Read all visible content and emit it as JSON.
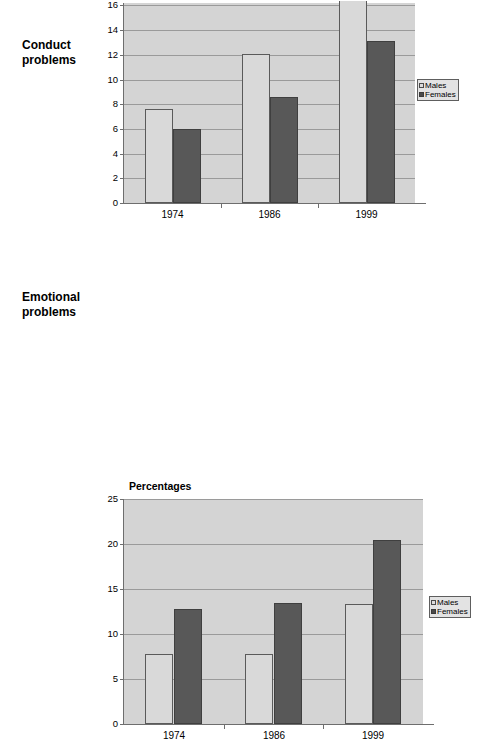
{
  "page": {
    "background": "#ffffff"
  },
  "colors": {
    "plot_background": "#d4d4d4",
    "males_fill": "#d9d9d9",
    "males_border": "#5a5a5a",
    "females_fill": "#585858",
    "females_border": "#3f3f3f",
    "gridline": "#9a9a9a",
    "axis": "#6e6e6e",
    "text": "#000000"
  },
  "panels": [
    {
      "id": "conduct",
      "row_label": "Conduct\nproblems"
    },
    {
      "id": "emotional",
      "row_label": "Emotional\nproblems"
    }
  ],
  "legend": {
    "series": [
      {
        "name": "Males",
        "swatch": "males"
      },
      {
        "name": "Females",
        "swatch": "females"
      }
    ]
  },
  "chart_data": [
    {
      "id": "conduct",
      "type": "bar",
      "title": "",
      "row_label": "Conduct problems",
      "xlabel": "",
      "ylabel": "",
      "categories": [
        "1974",
        "1986",
        "1999"
      ],
      "series": [
        {
          "name": "Males",
          "values": [
            7.6,
            12.1,
            17.6
          ]
        },
        {
          "name": "Females",
          "values": [
            6.0,
            8.6,
            13.1
          ]
        }
      ],
      "ylim": [
        0,
        16.2
      ],
      "yticks": [
        0,
        2,
        4,
        6,
        8,
        10,
        12,
        14,
        16
      ],
      "ytick_labels": [
        "0",
        "2",
        "4",
        "6",
        "8",
        "10",
        "12",
        "14",
        "16"
      ],
      "grid": true,
      "legend_position": "right",
      "notes": "Top of chart is cropped; the 1999 Males bar extends above the visible plot area."
    },
    {
      "id": "emotional",
      "type": "bar",
      "title": "Percentages",
      "row_label": "Emotional problems",
      "xlabel": "",
      "ylabel": "",
      "categories": [
        "1974",
        "1986",
        "1999"
      ],
      "series": [
        {
          "name": "Males",
          "values": [
            7.8,
            7.8,
            13.3
          ]
        },
        {
          "name": "Females",
          "values": [
            12.8,
            13.4,
            20.4
          ]
        }
      ],
      "ylim": [
        0,
        25
      ],
      "yticks": [
        0,
        5,
        10,
        15,
        20,
        25
      ],
      "ytick_labels": [
        "0",
        "5",
        "10",
        "15",
        "20",
        "25"
      ],
      "grid": true,
      "legend_position": "right"
    }
  ]
}
